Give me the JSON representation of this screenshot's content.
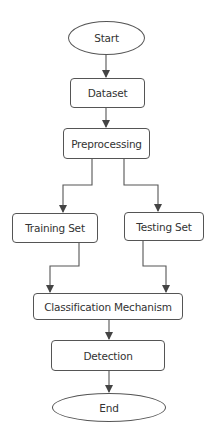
{
  "diagram": {
    "type": "flowchart",
    "nodes": [
      {
        "id": "start",
        "label": "Start",
        "shape": "ellipse"
      },
      {
        "id": "dataset",
        "label": "Dataset",
        "shape": "rect"
      },
      {
        "id": "preprocessing",
        "label": "Preprocessing",
        "shape": "rect"
      },
      {
        "id": "training",
        "label": "Training Set",
        "shape": "rect"
      },
      {
        "id": "testing",
        "label": "Testing Set",
        "shape": "rect"
      },
      {
        "id": "classification",
        "label": "Classification Mechanism",
        "shape": "rect"
      },
      {
        "id": "detection",
        "label": "Detection",
        "shape": "rect"
      },
      {
        "id": "end",
        "label": "End",
        "shape": "ellipse"
      }
    ],
    "edges": [
      {
        "from": "start",
        "to": "dataset"
      },
      {
        "from": "dataset",
        "to": "preprocessing"
      },
      {
        "from": "preprocessing",
        "to": "training"
      },
      {
        "from": "preprocessing",
        "to": "testing"
      },
      {
        "from": "training",
        "to": "classification"
      },
      {
        "from": "testing",
        "to": "classification"
      },
      {
        "from": "classification",
        "to": "detection"
      },
      {
        "from": "detection",
        "to": "end"
      }
    ],
    "colors": {
      "stroke": "#555555",
      "text": "#333333",
      "background": "#ffffff"
    }
  }
}
